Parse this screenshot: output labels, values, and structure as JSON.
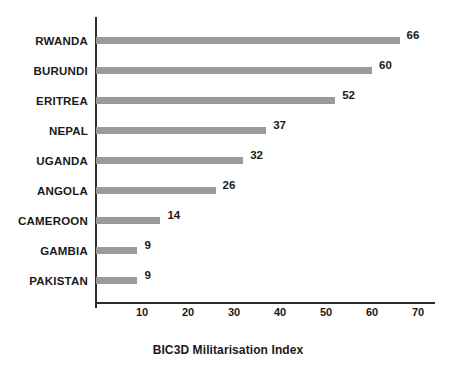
{
  "chart_data": {
    "type": "bar",
    "orientation": "horizontal",
    "title": "",
    "xlabel": "BIC3D Militarisation Index",
    "ylabel": "",
    "categories": [
      "RWANDA",
      "BURUNDI",
      "ERITREA",
      "NEPAL",
      "UGANDA",
      "ANGOLA",
      "CAMEROON",
      "GAMBIA",
      "PAKISTAN"
    ],
    "values": [
      66,
      60,
      52,
      37,
      32,
      26,
      14,
      9,
      9
    ],
    "data_labels": [
      "66",
      "60",
      "52",
      "37",
      "32",
      "26",
      "14",
      "9",
      "9"
    ],
    "xticks": [
      10,
      20,
      30,
      40,
      50,
      60,
      70
    ],
    "xtick_labels": [
      "10",
      "20",
      "30",
      "40",
      "50",
      "60",
      "70"
    ],
    "xlim": [
      0,
      73
    ],
    "grid": false,
    "legend": false,
    "bar_color": "#9a9a9a",
    "axis_color": "#2b2b2b",
    "text_color": "#1a1a1a",
    "background": "#ffffff"
  }
}
